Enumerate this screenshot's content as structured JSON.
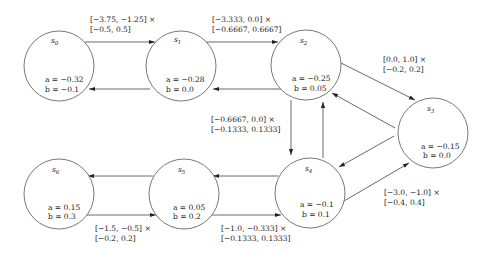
{
  "nodes": [
    {
      "id": "s0",
      "name": "s",
      "sub": "0",
      "a": "a = −0.32",
      "b": "b = −0.1"
    },
    {
      "id": "s1",
      "name": "s",
      "sub": "1",
      "a": "a = −0.28",
      "b": "b = 0.0"
    },
    {
      "id": "s2",
      "name": "s",
      "sub": "2",
      "a": "a = −0.25",
      "b": "b = 0.05"
    },
    {
      "id": "s3",
      "name": "s",
      "sub": "3",
      "a": "a = −0.15",
      "b": "b = 0.0"
    },
    {
      "id": "s4",
      "name": "s",
      "sub": "4",
      "a": "a = −0.1",
      "b": "b = 0.1"
    },
    {
      "id": "s5",
      "name": "s",
      "sub": "5",
      "a": "a = 0.05",
      "b": "b = 0.2"
    },
    {
      "id": "s6",
      "name": "s",
      "sub": "6",
      "a": "a = 0.15",
      "b": "b = 0.3"
    }
  ],
  "edges": [
    {
      "from": "s0",
      "to": "s1"
    },
    {
      "from": "s1",
      "to": "s0"
    },
    {
      "from": "s1",
      "to": "s2"
    },
    {
      "from": "s2",
      "to": "s1"
    },
    {
      "from": "s2",
      "to": "s3"
    },
    {
      "from": "s3",
      "to": "s2"
    },
    {
      "from": "s2",
      "to": "s4"
    },
    {
      "from": "s4",
      "to": "s2"
    },
    {
      "from": "s3",
      "to": "s4"
    },
    {
      "from": "s4",
      "to": "s3"
    },
    {
      "from": "s4",
      "to": "s5"
    },
    {
      "from": "s5",
      "to": "s4"
    },
    {
      "from": "s5",
      "to": "s6"
    },
    {
      "from": "s6",
      "to": "s5"
    }
  ],
  "edge_labels": [
    {
      "id": "s0-s1",
      "line1": "[−3.75, −1.25] ×",
      "line2": "[−0.5, 0.5]"
    },
    {
      "id": "s1-s2",
      "line1": "[−3.333, 0.0] ×",
      "line2": "[−0.6667, 0.6667]"
    },
    {
      "id": "s2-s3",
      "line1": "[0.0, 1.0] ×",
      "line2": "[−0.2, 0.2]"
    },
    {
      "id": "s2-s4",
      "line1": "[−0.6667, 0.0] ×",
      "line2": "[−0.1333, 0.1333]"
    },
    {
      "id": "s4-s3",
      "line1": "[−3.0, −1.0] ×",
      "line2": "[−0.4, 0.4]"
    },
    {
      "id": "s5-s4",
      "line1": "[−1.0, −0.333] ×",
      "line2": "[−0.1333, 0.1333]"
    },
    {
      "id": "s6-s5",
      "line1": "[−1.5, −0.5] ×",
      "line2": "[−0.2, 0.2]"
    }
  ]
}
